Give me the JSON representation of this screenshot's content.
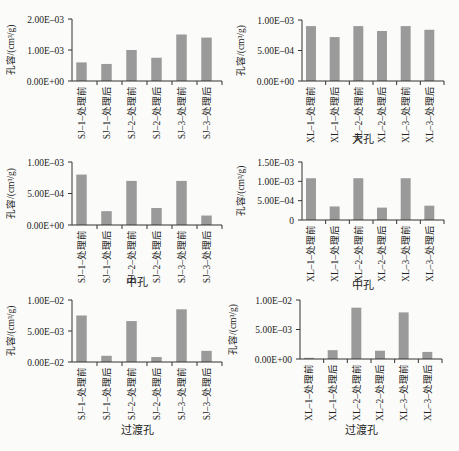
{
  "figure": {
    "bar_color": "#9a9a9a",
    "axis_color": "#333333",
    "ylabel": "孔容/(cm³/g)"
  },
  "chart_data": [
    {
      "type": "bar",
      "id": "sj-macro",
      "title": "大孔",
      "xlabel": "大孔",
      "ylabel": "孔容/(cm³/g)",
      "categories": [
        "SJ–1–处理前",
        "SJ–1–处理后",
        "SJ–2–处理前",
        "SJ–2–处理后",
        "SJ–3–处理前",
        "SJ–3–处理后"
      ],
      "values": [
        0.0006,
        0.00055,
        0.001,
        0.00075,
        0.0015,
        0.0014
      ],
      "ylim": [
        0,
        0.002
      ],
      "yticks": [
        0,
        0.001,
        0.002
      ],
      "ytick_labels": [
        "0.00E+00",
        "1.00E–03",
        "2.00E–03"
      ],
      "xlabel_visible": false,
      "grid": false
    },
    {
      "type": "bar",
      "id": "xl-macro",
      "title": "大孔",
      "xlabel": "大孔",
      "ylabel": "孔容/(cm³/g)",
      "categories": [
        "XL–1–处理前",
        "XL–1–处理后",
        "XL–2–处理前",
        "XL–2–处理后",
        "XL–3–处理前",
        "XL–3–处理后"
      ],
      "values": [
        0.0009,
        0.00072,
        0.0009,
        0.00082,
        0.0009,
        0.00084
      ],
      "ylim": [
        0,
        0.001
      ],
      "yticks": [
        0,
        0.0005,
        0.001
      ],
      "ytick_labels": [
        "0.00E+00",
        "5.00E–04",
        "1.00E–03"
      ],
      "xlabel_visible": true,
      "grid": false
    },
    {
      "type": "bar",
      "id": "sj-meso",
      "title": "中孔",
      "xlabel": "中孔",
      "ylabel": "孔容/(cm³/g)",
      "categories": [
        "SJ–1–处理前",
        "SJ–1–处理后",
        "SJ–2–处理前",
        "SJ–2–处理后",
        "SJ–3–处理前",
        "SJ–3–处理后"
      ],
      "values": [
        0.0008,
        0.00022,
        0.0007,
        0.00027,
        0.0007,
        0.00015
      ],
      "ylim": [
        0,
        0.001
      ],
      "yticks": [
        0,
        0.0005,
        0.001
      ],
      "ytick_labels": [
        "0.00E+00",
        "5.00E–04",
        "1.00E–03"
      ],
      "xlabel_visible": true,
      "grid": false
    },
    {
      "type": "bar",
      "id": "xl-meso",
      "title": "中孔",
      "xlabel": "中孔",
      "ylabel": "孔容/(cm³/g)",
      "categories": [
        "XL–1–处理前",
        "XL–1–处理后",
        "XL–2–处理前",
        "XL–2–处理后",
        "XL–3–处理前",
        "XL–3–处理后"
      ],
      "values": [
        0.00108,
        0.00035,
        0.00108,
        0.00032,
        0.00108,
        0.00037
      ],
      "ylim": [
        0,
        0.0015
      ],
      "yticks": [
        0,
        0.0005,
        0.001,
        0.0015
      ],
      "ytick_labels": [
        "0",
        "5.00E–04",
        "1.00E–03",
        "1.50E–03"
      ],
      "xlabel_visible": true,
      "grid": false
    },
    {
      "type": "bar",
      "id": "sj-transition",
      "title": "过渡孔",
      "xlabel": "过渡孔",
      "ylabel": "孔容/(cm³/g)",
      "categories": [
        "SJ–1–处理前",
        "SJ–1–处理后",
        "SJ–2–处理前",
        "SJ–2–处理后",
        "SJ–3–处理前",
        "SJ–3–处理后"
      ],
      "values": [
        0.0075,
        0.001,
        0.0066,
        0.0008,
        0.0085,
        0.0018
      ],
      "ylim": [
        0,
        0.01
      ],
      "yticks": [
        0,
        0.005,
        0.01
      ],
      "ytick_labels": [
        "0.00E–02",
        "5.00E–03",
        "1.00E–02"
      ],
      "xlabel_visible": true,
      "grid": false
    },
    {
      "type": "bar",
      "id": "xl-transition",
      "title": "过渡孔",
      "xlabel": "过渡孔",
      "ylabel": "孔容/(cm³/g)",
      "categories": [
        "XL–1–处理前",
        "XL–1–处理后",
        "XL–2–处理前",
        "XL–2–处理后",
        "XL–3–处理前",
        "XL–3–处理后"
      ],
      "values": [
        0.0002,
        0.0015,
        0.0087,
        0.0014,
        0.0079,
        0.0012
      ],
      "ylim": [
        0,
        0.01
      ],
      "yticks": [
        0,
        0.005,
        0.01
      ],
      "ytick_labels": [
        "0.00E+00",
        "5.00E–03",
        "1.00E–02"
      ],
      "xlabel_visible": true,
      "grid": false
    }
  ]
}
